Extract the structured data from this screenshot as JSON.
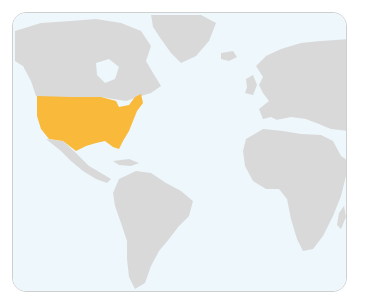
{
  "map": {
    "title": "World map highlighting the United States",
    "highlighted_country": "United States",
    "colors": {
      "ocean": "#eef7fb",
      "land": "#d9d9d9",
      "highlight": "#f9b93a",
      "border": "#cfcfcf"
    },
    "regions_visible": [
      "North America",
      "Greenland",
      "Europe",
      "Africa",
      "South America",
      "Central America",
      "Caribbean"
    ]
  }
}
